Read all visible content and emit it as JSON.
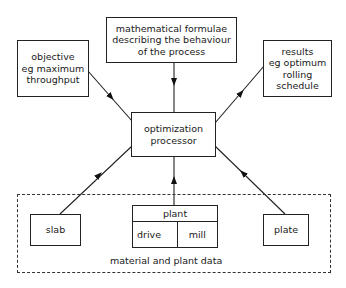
{
  "diagram": {
    "nodes": {
      "formulae": {
        "text": "mathematical formulae\ndescribing the behaviour\nof the process"
      },
      "objective": {
        "text": "objective\neg maximum\nthroughput"
      },
      "results": {
        "text": "results\neg optimum\nrolling\nschedule"
      },
      "processor": {
        "text": "optimization\nprocessor"
      },
      "slab": {
        "text": "slab"
      },
      "plant": {
        "header": "plant",
        "left": "drive",
        "right": "mill"
      },
      "plate": {
        "text": "plate"
      }
    },
    "group": {
      "label": "material and plant data",
      "style": "dashed"
    },
    "edges": [
      {
        "from": "formulae",
        "to": "processor"
      },
      {
        "from": "objective",
        "to": "processor"
      },
      {
        "from": "processor",
        "to": "results"
      },
      {
        "from": "slab",
        "to": "processor"
      },
      {
        "from": "plant",
        "to": "processor"
      },
      {
        "from": "plate",
        "to": "processor"
      }
    ],
    "colors": {
      "line": "#222222",
      "background": "#ffffff"
    }
  }
}
